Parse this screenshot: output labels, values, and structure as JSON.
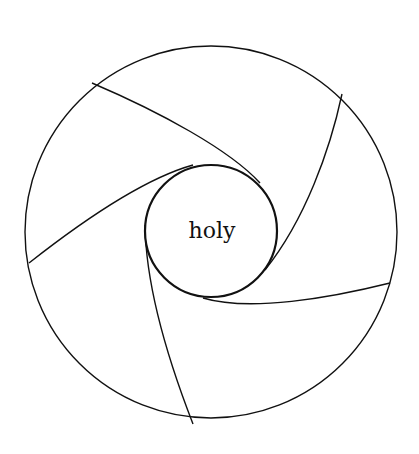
{
  "diagram": {
    "center_label": "holy",
    "colors": {
      "stroke": "#111111",
      "background": "#ffffff"
    },
    "outer_circle": {
      "cx": 211,
      "cy": 232,
      "r": 186
    },
    "inner_circle": {
      "cx": 211,
      "cy": 231,
      "r": 66
    },
    "spiral_arms": [
      {
        "id": "arm-1",
        "from": [
          92,
          83
        ],
        "to": [
          260,
          183
        ],
        "c1": [
          160,
          112
        ],
        "c2": [
          230,
          150
        ]
      },
      {
        "id": "arm-2",
        "from": [
          342,
          94
        ],
        "to": [
          265,
          270
        ],
        "c1": [
          330,
          150
        ],
        "c2": [
          305,
          220
        ]
      },
      {
        "id": "arm-3",
        "from": [
          390,
          283
        ],
        "to": [
          203,
          298
        ],
        "c1": [
          330,
          298
        ],
        "c2": [
          250,
          312
        ]
      },
      {
        "id": "arm-4",
        "from": [
          193,
          424
        ],
        "to": [
          145,
          225
        ],
        "c1": [
          172,
          370
        ],
        "c2": [
          146,
          290
        ]
      },
      {
        "id": "arm-5",
        "from": [
          29,
          263
        ],
        "to": [
          193,
          165
        ],
        "c1": [
          90,
          215
        ],
        "c2": [
          150,
          177
        ]
      }
    ]
  }
}
